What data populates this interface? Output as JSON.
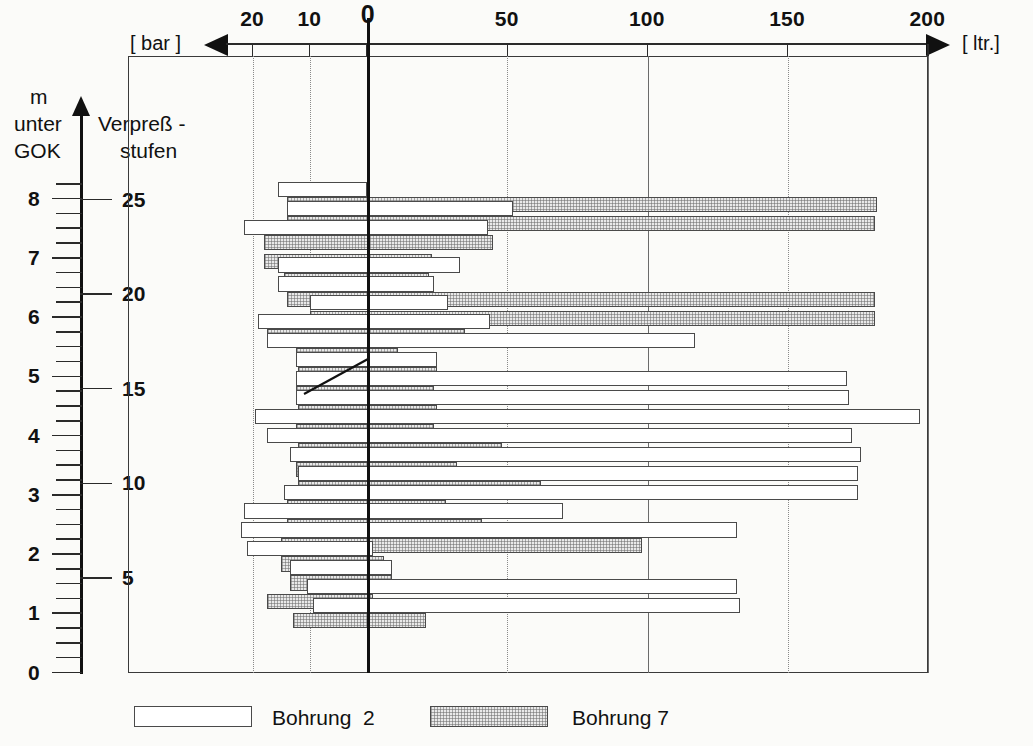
{
  "figure": {
    "left_axis_unit": "[ bar ]",
    "right_axis_unit": "[ ltr.]",
    "y_axis_label_line1": "m",
    "y_axis_label_line2": "unter",
    "y_axis_label_line3": "GOK",
    "stage_label_line1": "Verpreß -",
    "stage_label_line2": "stufen"
  },
  "legend": {
    "items": [
      {
        "name": "bohrung-2",
        "label": "Bohrung  2",
        "fill": "white"
      },
      {
        "name": "bohrung-7",
        "label": "Bohrung 7",
        "fill": "stipple"
      }
    ]
  },
  "chart_data": {
    "type": "bar",
    "orientation": "horizontal-diverging",
    "title": "",
    "xlabel_left": "[ bar ]",
    "xlabel_right": "[ ltr.]",
    "ylabel_left": "m unter GOK",
    "ylabel_right": "Verpreßstufen",
    "grid": true,
    "legend_position": "bottom",
    "x_left_axis": {
      "name": "Verpreßdruck",
      "unit": "bar",
      "ticks": [
        20,
        10,
        0
      ],
      "tick_labels": [
        "20",
        "10",
        "0"
      ],
      "range": [
        22,
        0
      ],
      "direction": "leftward"
    },
    "x_right_axis": {
      "name": "Verpreßgut",
      "unit": "ltr.",
      "ticks": [
        0,
        50,
        100,
        150,
        200
      ],
      "tick_labels": [
        "0",
        "50",
        "100",
        "150",
        "200"
      ],
      "range": [
        0,
        200
      ],
      "direction": "rightward"
    },
    "y_axis_left": {
      "name": "m unter GOK",
      "unit": "m",
      "ticks": [
        0,
        1,
        2,
        3,
        4,
        5,
        6,
        7,
        8
      ],
      "tick_labels": [
        "0",
        "1",
        "2",
        "3",
        "4",
        "5",
        "6",
        "7",
        "8"
      ],
      "minor_ticks_per_unit": 3,
      "range": [
        0,
        8.4
      ]
    },
    "y_axis_right": {
      "name": "Verpreßstufen",
      "ticks": [
        5,
        10,
        15,
        20,
        25
      ],
      "tick_labels": [
        "5",
        "10",
        "15",
        "20",
        "25"
      ],
      "range": [
        0,
        26.3
      ]
    },
    "series": [
      {
        "name": "Bohrung 2",
        "fill": "white",
        "key": "b2"
      },
      {
        "name": "Bohrung 7",
        "fill": "stipple",
        "key": "b7"
      }
    ],
    "stages": [
      {
        "stufe": 25,
        "b2": {
          "bar": 15.5,
          "ltr": 0
        },
        "b7": {
          "bar": 14.0,
          "ltr": 182
        }
      },
      {
        "stufe": 24,
        "b2": {
          "bar": 14.0,
          "ltr": 52
        },
        "b7": {
          "bar": 14.0,
          "ltr": 181
        }
      },
      {
        "stufe": 23,
        "b2": {
          "bar": 21.5,
          "ltr": 43
        },
        "b7": {
          "bar": 18.0,
          "ltr": 45
        }
      },
      {
        "stufe": 22,
        "b2": {
          "bar": 0,
          "ltr": 0
        },
        "b7": {
          "bar": 18.0,
          "ltr": 23
        }
      },
      {
        "stufe": 21,
        "b2": {
          "bar": 15.5,
          "ltr": 33
        },
        "b7": {
          "bar": 14.5,
          "ltr": 22
        }
      },
      {
        "stufe": 20,
        "b2": {
          "bar": 15.5,
          "ltr": 24
        },
        "b7": {
          "bar": 14.0,
          "ltr": 181
        }
      },
      {
        "stufe": 19,
        "b2": {
          "bar": 10.0,
          "ltr": 29
        },
        "b7": {
          "bar": 10.0,
          "ltr": 181
        }
      },
      {
        "stufe": 18,
        "b2": {
          "bar": 19.0,
          "ltr": 44
        },
        "b7": {
          "bar": 17.5,
          "ltr": 35
        }
      },
      {
        "stufe": 17,
        "b2": {
          "bar": 17.5,
          "ltr": 117
        },
        "b7": {
          "bar": 12.5,
          "ltr": 11
        }
      },
      {
        "stufe": 16,
        "b2": {
          "bar": 12.5,
          "ltr": 25
        },
        "b7": {
          "bar": 12.0,
          "ltr": 25
        }
      },
      {
        "stufe": 15,
        "b2": {
          "bar": 12.5,
          "ltr": 171
        },
        "b7": {
          "bar": 12.5,
          "ltr": 24
        }
      },
      {
        "stufe": 14,
        "b2": {
          "bar": 12.5,
          "ltr": 172
        },
        "b7": {
          "bar": 12.0,
          "ltr": 25
        }
      },
      {
        "stufe": 13,
        "b2": {
          "bar": 19.5,
          "ltr": 197
        },
        "b7": {
          "bar": 12.5,
          "ltr": 24
        }
      },
      {
        "stufe": 12,
        "b2": {
          "bar": 17.5,
          "ltr": 173
        },
        "b7": {
          "bar": 12.0,
          "ltr": 48
        }
      },
      {
        "stufe": 11,
        "b2": {
          "bar": 13.5,
          "ltr": 176
        },
        "b7": {
          "bar": 12.5,
          "ltr": 32
        }
      },
      {
        "stufe": 10,
        "b2": {
          "bar": 12.0,
          "ltr": 175
        },
        "b7": {
          "bar": 12.0,
          "ltr": 62
        }
      },
      {
        "stufe": 9,
        "b2": {
          "bar": 14.5,
          "ltr": 175
        },
        "b7": {
          "bar": 14.0,
          "ltr": 28
        }
      },
      {
        "stufe": 8,
        "b2": {
          "bar": 21.5,
          "ltr": 70
        },
        "b7": {
          "bar": 14.0,
          "ltr": 41
        }
      },
      {
        "stufe": 7,
        "b2": {
          "bar": 22.0,
          "ltr": 132
        },
        "b7": {
          "bar": 15.0,
          "ltr": 98
        }
      },
      {
        "stufe": 6,
        "b2": {
          "bar": 21.0,
          "ltr": 2
        },
        "b7": {
          "bar": 15.0,
          "ltr": 6
        }
      },
      {
        "stufe": 5,
        "b2": {
          "bar": 13.5,
          "ltr": 9
        },
        "b7": {
          "bar": 13.5,
          "ltr": 9
        }
      },
      {
        "stufe": 4,
        "b2": {
          "bar": 10.5,
          "ltr": 132
        },
        "b7": {
          "bar": 17.5,
          "ltr": 2
        }
      },
      {
        "stufe": 3,
        "b2": {
          "bar": 9.5,
          "ltr": 133
        },
        "b7": {
          "bar": 13.0,
          "ltr": 21
        }
      }
    ]
  }
}
